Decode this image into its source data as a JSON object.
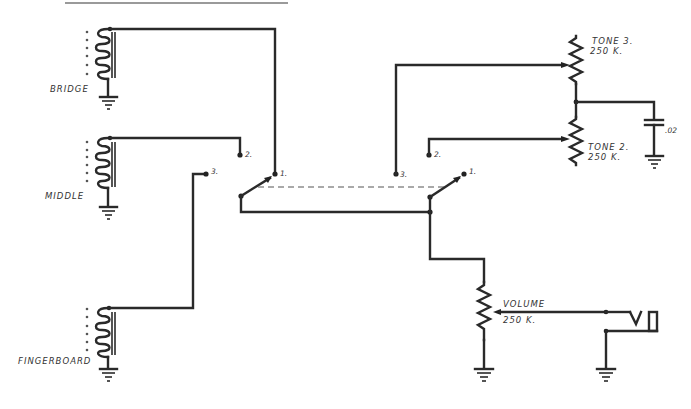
{
  "diagram": {
    "type": "electrical-schematic",
    "pickups": [
      {
        "id": "bridge",
        "label": "BRIDGE"
      },
      {
        "id": "middle",
        "label": "MIDDLE"
      },
      {
        "id": "fingerboard",
        "label": "FINGERBOARD"
      }
    ],
    "switches": [
      {
        "id": "pickup-selector",
        "positions": [
          "1.",
          "2.",
          "3."
        ]
      },
      {
        "id": "tone-selector",
        "positions": [
          "1.",
          "2.",
          "3."
        ]
      }
    ],
    "components": {
      "tone3": {
        "name": "TONE 3.",
        "value": "250 K."
      },
      "tone2": {
        "name": "TONE 2.",
        "value": "250 K."
      },
      "capacitor": {
        "value": ".02"
      },
      "volume": {
        "name": "VOLUME",
        "value": "250 K."
      }
    },
    "output": {
      "type": "jack"
    }
  }
}
